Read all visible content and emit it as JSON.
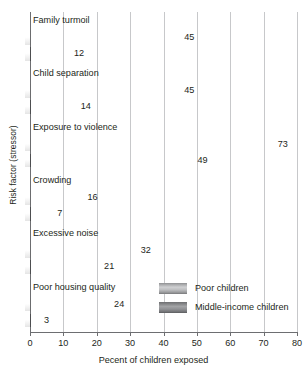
{
  "chart_data": {
    "type": "bar",
    "orientation": "horizontal",
    "title": "",
    "xlabel": "Pecent of children exposed",
    "ylabel": "Risk factor (stressor)",
    "xlim": [
      0,
      80
    ],
    "xticks": [
      0,
      10,
      20,
      30,
      40,
      50,
      60,
      70,
      80
    ],
    "grid": "vertical",
    "legend_position": "inside-lower-right",
    "categories": [
      "Family turmoil",
      "Child separation",
      "Exposure to violence",
      "Crowding",
      "Excessive noise",
      "Poor housing quality"
    ],
    "series": [
      {
        "name": "Poor children",
        "color": "#bdbec0",
        "values": [
          45,
          45,
          73,
          16,
          32,
          24
        ]
      },
      {
        "name": "Middle-income children",
        "color": "#8a8b8d",
        "values": [
          12,
          14,
          49,
          7,
          21,
          3
        ]
      }
    ]
  },
  "legend": {
    "items": [
      {
        "label": "Poor children",
        "swatch": "poor"
      },
      {
        "label": "Middle-income children",
        "swatch": "middle"
      }
    ]
  }
}
